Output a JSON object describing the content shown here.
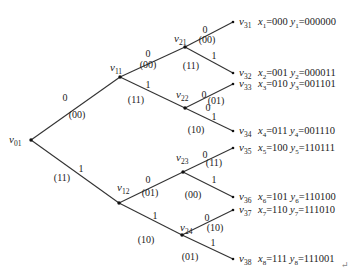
{
  "diagram": {
    "type": "code-tree",
    "nodes": [
      {
        "id": "v01",
        "base": "v",
        "sub": "01",
        "x": 31,
        "y": 140,
        "label_dx": -22,
        "label_dy": 3
      },
      {
        "id": "v11",
        "base": "v",
        "sub": "11",
        "x": 120,
        "y": 77,
        "label_dx": -10,
        "label_dy": -6
      },
      {
        "id": "v12",
        "base": "v",
        "sub": "12",
        "x": 119,
        "y": 203,
        "label_dx": -2,
        "label_dy": -12
      },
      {
        "id": "v21",
        "base": "v",
        "sub": "21",
        "x": 185,
        "y": 47,
        "label_dx": -11,
        "label_dy": -5
      },
      {
        "id": "v22",
        "base": "v",
        "sub": "22",
        "x": 185,
        "y": 108,
        "label_dx": -9,
        "label_dy": -10
      },
      {
        "id": "v23",
        "base": "v",
        "sub": "23",
        "x": 183,
        "y": 172,
        "label_dx": -7,
        "label_dy": -11
      },
      {
        "id": "v24",
        "base": "v",
        "sub": "24",
        "x": 182,
        "y": 235,
        "label_dx": -2,
        "label_dy": -4
      },
      {
        "id": "v31",
        "base": "v",
        "sub": "31",
        "x": 233,
        "y": 22,
        "label_dx": 6,
        "label_dy": 3
      },
      {
        "id": "v32",
        "base": "v",
        "sub": "32",
        "x": 233,
        "y": 73,
        "label_dx": 6,
        "label_dy": 3
      },
      {
        "id": "v33",
        "base": "v",
        "sub": "33",
        "x": 233,
        "y": 84,
        "label_dx": 6,
        "label_dy": 3
      },
      {
        "id": "v34",
        "base": "v",
        "sub": "34",
        "x": 233,
        "y": 131,
        "label_dx": 6,
        "label_dy": 3
      },
      {
        "id": "v35",
        "base": "v",
        "sub": "35",
        "x": 233,
        "y": 148,
        "label_dx": 6,
        "label_dy": 3
      },
      {
        "id": "v36",
        "base": "v",
        "sub": "36",
        "x": 233,
        "y": 197,
        "label_dx": 6,
        "label_dy": 3
      },
      {
        "id": "v37",
        "base": "v",
        "sub": "37",
        "x": 233,
        "y": 210,
        "label_dx": 6,
        "label_dy": 3
      },
      {
        "id": "v38",
        "base": "v",
        "sub": "38",
        "x": 233,
        "y": 259,
        "label_dx": 6,
        "label_dy": 3
      }
    ],
    "edges": [
      {
        "from": "v01",
        "to": "v11",
        "bit": "0",
        "output": "(00)",
        "bit_pos": [
          65,
          101
        ],
        "out_pos": [
          77,
          118
        ]
      },
      {
        "from": "v01",
        "to": "v12",
        "bit": "1",
        "output": "(11)",
        "bit_pos": [
          81,
          172
        ],
        "out_pos": [
          62,
          181
        ]
      },
      {
        "from": "v11",
        "to": "v21",
        "bit": "0",
        "output": "(00)",
        "bit_pos": [
          148,
          57
        ],
        "out_pos": [
          148,
          68
        ]
      },
      {
        "from": "v11",
        "to": "v22",
        "bit": "1",
        "output": "(11)",
        "bit_pos": [
          148,
          88
        ],
        "out_pos": [
          136,
          103
        ]
      },
      {
        "from": "v12",
        "to": "v23",
        "bit": "0",
        "output": "(01)",
        "bit_pos": [
          148,
          183
        ],
        "out_pos": [
          150,
          196
        ]
      },
      {
        "from": "v12",
        "to": "v24",
        "bit": "1",
        "output": "(10)",
        "bit_pos": [
          155,
          219
        ],
        "out_pos": [
          146,
          243
        ]
      },
      {
        "from": "v21",
        "to": "v31",
        "bit": "0",
        "output": "(00)",
        "bit_pos": [
          205,
          33
        ],
        "out_pos": [
          207,
          43
        ]
      },
      {
        "from": "v21",
        "to": "v32",
        "bit": "1",
        "output": "(11)",
        "bit_pos": [
          214,
          59
        ],
        "out_pos": [
          191,
          69
        ]
      },
      {
        "from": "v22",
        "to": "v33",
        "bit": "0",
        "output": "(01)",
        "bit_pos": [
          204,
          98
        ],
        "out_pos": [
          216,
          104
        ]
      },
      {
        "from": "v22",
        "to": "v34",
        "bit": "1",
        "output": "(10)",
        "bit_pos": [
          214,
          120
        ],
        "out_pos": [
          196,
          133
        ]
      },
      {
        "from": "v23",
        "to": "v35",
        "bit": "0",
        "output": "(11)",
        "bit_pos": [
          205,
          158
        ],
        "out_pos": [
          214,
          166
        ]
      },
      {
        "from": "v23",
        "to": "v36",
        "bit": "1",
        "output": "(00)",
        "bit_pos": [
          214,
          183
        ],
        "out_pos": [
          193,
          198
        ]
      },
      {
        "from": "v24",
        "to": "v37",
        "bit": "0",
        "output": "(10)",
        "bit_pos": [
          207,
          221
        ],
        "out_pos": [
          215,
          231
        ]
      },
      {
        "from": "v24",
        "to": "v38",
        "bit": "1",
        "output": "(01)",
        "bit_pos": [
          213,
          246
        ],
        "out_pos": [
          190,
          260
        ]
      }
    ],
    "extra_labels": [
      {
        "text": "0",
        "x": 208,
        "y": 111
      }
    ],
    "leaves": [
      {
        "node": "v31",
        "x_sub": "1",
        "x_val": "000",
        "y_sub": "1",
        "y_val": "000000"
      },
      {
        "node": "v32",
        "x_sub": "2",
        "x_val": "001",
        "y_sub": "2",
        "y_val": "000011"
      },
      {
        "node": "v33",
        "x_sub": "3",
        "x_val": "010",
        "y_sub": "3",
        "y_val": "001101"
      },
      {
        "node": "v34",
        "x_sub": "4",
        "x_val": "011",
        "y_sub": "4",
        "y_val": "001110"
      },
      {
        "node": "v35",
        "x_sub": "5",
        "x_val": "100",
        "y_sub": "5",
        "y_val": "110111"
      },
      {
        "node": "v36",
        "x_sub": "6",
        "x_val": "101",
        "y_sub": "6",
        "y_val": "110100"
      },
      {
        "node": "v37",
        "x_sub": "7",
        "x_val": "110",
        "y_sub": "7",
        "y_val": "111010"
      },
      {
        "node": "v38",
        "x_sub": "8",
        "x_val": "111",
        "y_sub": "8",
        "y_val": "111001"
      }
    ],
    "return_mark": {
      "symbol": "↵",
      "x": 341,
      "y": 268
    }
  }
}
